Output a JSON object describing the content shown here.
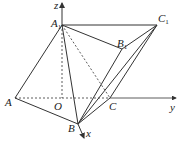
{
  "diagram": {
    "type": "3d-coordinate-prism",
    "stroke_color": "#333333",
    "points": {
      "A1": {
        "label": "A",
        "sub": "1",
        "x": 62,
        "y": 25
      },
      "B1": {
        "label": "B",
        "sub": "1",
        "x": 122,
        "y": 49
      },
      "C1": {
        "label": "C",
        "sub": "1",
        "x": 157,
        "y": 25
      },
      "A": {
        "label": "A",
        "sub": "",
        "x": 15,
        "y": 98
      },
      "O": {
        "label": "O",
        "sub": "",
        "x": 62,
        "y": 98
      },
      "C": {
        "label": "C",
        "sub": "",
        "x": 110,
        "y": 98
      },
      "B": {
        "label": "B",
        "sub": "",
        "x": 78,
        "y": 124
      }
    },
    "axes": {
      "z": {
        "label": "z"
      },
      "y": {
        "label": "y"
      },
      "x": {
        "label": "x"
      }
    },
    "solid_edges": [
      [
        "A1",
        "C1"
      ],
      [
        "A1",
        "B1"
      ],
      [
        "B1",
        "C1"
      ],
      [
        "A1",
        "A"
      ],
      [
        "A",
        "B"
      ],
      [
        "A1",
        "B"
      ],
      [
        "B",
        "B1"
      ],
      [
        "B",
        "C1"
      ],
      [
        "C",
        "C1"
      ],
      [
        "B",
        "C"
      ]
    ],
    "dashed_edges": [
      [
        "A",
        "O"
      ],
      [
        "O",
        "C"
      ],
      [
        "A1",
        "O"
      ],
      [
        "A1",
        "C"
      ]
    ]
  }
}
